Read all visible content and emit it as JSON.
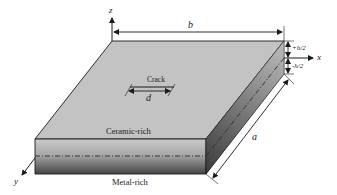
{
  "diagram": {
    "axes": {
      "z": "z",
      "x": "x",
      "y": "y"
    },
    "dimensions": {
      "width_label": "b",
      "length_label": "a",
      "upper_half_thickness": "+h/2",
      "lower_half_thickness": "-h/2",
      "crack_length": "d"
    },
    "labels": {
      "crack": "Crack",
      "top_surface": "Ceramic-rich",
      "bottom_surface": "Metal-rich"
    },
    "colors": {
      "top_face": "#c4c4c4",
      "front_face_top": "#c8c8c8",
      "front_face_bottom": "#4a4a4a",
      "side_face_top": "#b0b0b0",
      "side_face_bottom": "#3a3a3a",
      "edge": "#1a1a1a",
      "background": "#ffffff"
    }
  }
}
